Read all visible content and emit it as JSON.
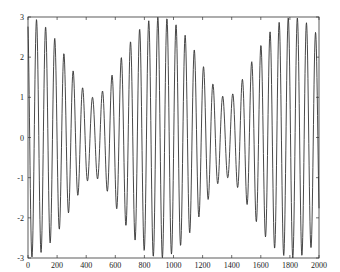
{
  "chart_data": {
    "type": "line",
    "title": "",
    "xlabel": "",
    "ylabel": "",
    "xlim": [
      0,
      2000
    ],
    "ylim": [
      -3,
      3
    ],
    "grid": false,
    "legend": null,
    "x_ticks": [
      0,
      200,
      400,
      600,
      800,
      1000,
      1200,
      1400,
      1600,
      1800,
      2000
    ],
    "x_tick_labels": [
      "0",
      "200",
      "400",
      "600",
      "800",
      "1000",
      "1200",
      "1400",
      "1600",
      "1800",
      "2000"
    ],
    "y_ticks": [
      -3,
      -2,
      -1,
      0,
      1,
      2,
      3
    ],
    "y_tick_labels": [
      "-3",
      "-2",
      "-1",
      "0",
      "1",
      "2",
      "3"
    ],
    "line_color": "#333333",
    "series": [
      {
        "name": "signal",
        "description": "Beating sinusoid: sum of two close-frequency cosines (amplitudes 2 and 1)",
        "model": {
          "components": [
            {
              "amplitude": 2,
              "period": 64,
              "phase_shift": 4
            },
            {
              "amplitude": 1,
              "period": 59.8,
              "phase_shift": 4
            }
          ],
          "carrier_period": 64,
          "beat_period": 905,
          "sample_step": 2
        },
        "envelope": {
          "max_amplitude": 3,
          "min_amplitude": 1,
          "maxima_at_x": [
            0,
            905,
            1810
          ],
          "minima_at_x": [
            452,
            1357
          ]
        },
        "approx_extrema": [
          {
            "x": 28,
            "y": -2.95
          },
          {
            "x": 58,
            "y": 2.9
          },
          {
            "x": 92,
            "y": -2.8
          },
          {
            "x": 122,
            "y": 2.65
          },
          {
            "x": 156,
            "y": -2.5
          },
          {
            "x": 186,
            "y": 2.3
          },
          {
            "x": 220,
            "y": -2.1
          },
          {
            "x": 250,
            "y": 1.85
          },
          {
            "x": 284,
            "y": -1.6
          },
          {
            "x": 314,
            "y": 1.45
          },
          {
            "x": 348,
            "y": -1.25
          },
          {
            "x": 378,
            "y": 1.2
          },
          {
            "x": 412,
            "y": -1.05
          },
          {
            "x": 442,
            "y": 1.0
          },
          {
            "x": 476,
            "y": -1.0
          },
          {
            "x": 506,
            "y": 1.05
          },
          {
            "x": 540,
            "y": -1.2
          },
          {
            "x": 570,
            "y": 1.3
          },
          {
            "x": 604,
            "y": -1.5
          },
          {
            "x": 634,
            "y": 1.7
          },
          {
            "x": 668,
            "y": -1.95
          },
          {
            "x": 698,
            "y": 2.1
          },
          {
            "x": 732,
            "y": -2.4
          },
          {
            "x": 762,
            "y": 2.55
          },
          {
            "x": 796,
            "y": -2.75
          },
          {
            "x": 826,
            "y": 2.85
          },
          {
            "x": 860,
            "y": -2.95
          },
          {
            "x": 890,
            "y": 3.0
          },
          {
            "x": 924,
            "y": -3.0
          },
          {
            "x": 954,
            "y": 2.95
          },
          {
            "x": 988,
            "y": -2.85
          },
          {
            "x": 1018,
            "y": 2.7
          },
          {
            "x": 1052,
            "y": -2.55
          },
          {
            "x": 1082,
            "y": 2.35
          },
          {
            "x": 1116,
            "y": -2.15
          },
          {
            "x": 1146,
            "y": 1.9
          },
          {
            "x": 1180,
            "y": -1.65
          },
          {
            "x": 1210,
            "y": 1.5
          },
          {
            "x": 1244,
            "y": -1.3
          },
          {
            "x": 1274,
            "y": 1.2
          },
          {
            "x": 1308,
            "y": -1.05
          },
          {
            "x": 1338,
            "y": 1.0
          },
          {
            "x": 1372,
            "y": -1.0
          },
          {
            "x": 1402,
            "y": 1.05
          },
          {
            "x": 1436,
            "y": -1.15
          },
          {
            "x": 1466,
            "y": 1.25
          },
          {
            "x": 1500,
            "y": -1.45
          },
          {
            "x": 1530,
            "y": 1.65
          },
          {
            "x": 1564,
            "y": -1.9
          },
          {
            "x": 1594,
            "y": 2.05
          },
          {
            "x": 1628,
            "y": -2.3
          },
          {
            "x": 1658,
            "y": 2.5
          },
          {
            "x": 1692,
            "y": -2.7
          },
          {
            "x": 1722,
            "y": 2.8
          },
          {
            "x": 1756,
            "y": -2.9
          },
          {
            "x": 1786,
            "y": 3.0
          },
          {
            "x": 1820,
            "y": -3.0
          },
          {
            "x": 1850,
            "y": 2.95
          },
          {
            "x": 1884,
            "y": -2.9
          },
          {
            "x": 1914,
            "y": 2.8
          },
          {
            "x": 1948,
            "y": -2.6
          },
          {
            "x": 1978,
            "y": 2.45
          }
        ]
      }
    ]
  },
  "layout": {
    "plot_left": 28,
    "plot_top": 17,
    "plot_right": 319,
    "plot_bottom": 258
  }
}
